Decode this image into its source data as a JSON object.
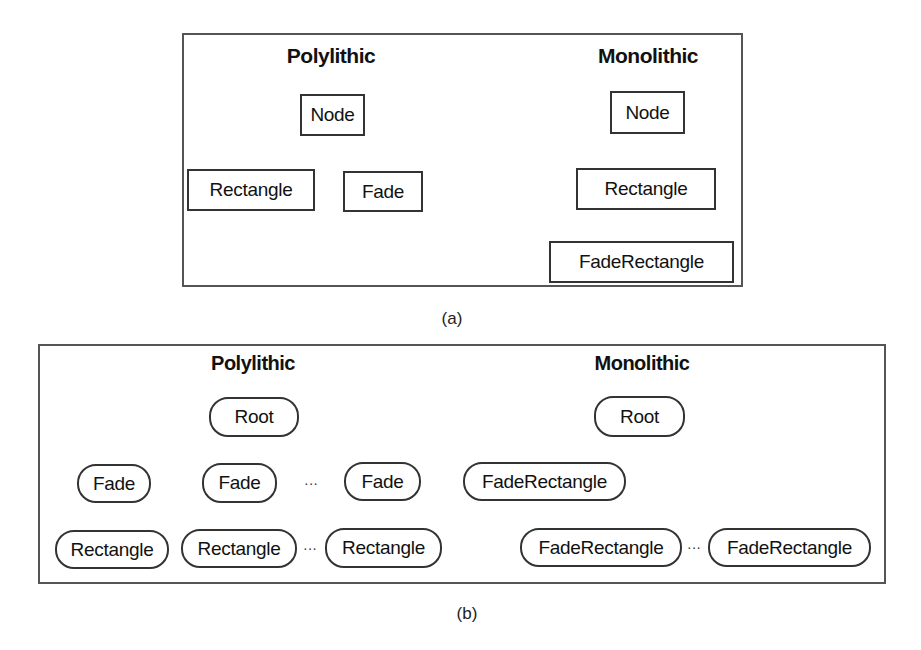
{
  "figure_a": {
    "caption": "(a)",
    "polylithic": {
      "title": "Polylithic",
      "nodes": [
        "Node",
        "Rectangle",
        "Fade"
      ],
      "edges": [
        [
          "Node",
          "Rectangle"
        ],
        [
          "Node",
          "Fade"
        ]
      ]
    },
    "monolithic": {
      "title": "Monolithic",
      "nodes": [
        "Node",
        "Rectangle",
        "FadeRectangle"
      ],
      "edges": [
        [
          "Node",
          "Rectangle"
        ],
        [
          "Rectangle",
          "FadeRectangle"
        ]
      ]
    }
  },
  "figure_b": {
    "caption": "(b)",
    "polylithic": {
      "title": "Polylithic",
      "root": "Root",
      "fades": [
        "Fade",
        "Fade",
        "Fade"
      ],
      "rectangles": [
        "Rectangle",
        "Rectangle",
        "Rectangle"
      ],
      "ellipsis": "···"
    },
    "monolithic": {
      "title": "Monolithic",
      "root": "Root",
      "children": [
        "FadeRectangle",
        "FadeRectangle",
        "FadeRectangle"
      ],
      "ellipsis": "···"
    }
  },
  "colors": {
    "frame": "#555555",
    "box_border": "#333333",
    "edge": "#999999",
    "text": "#111111"
  }
}
